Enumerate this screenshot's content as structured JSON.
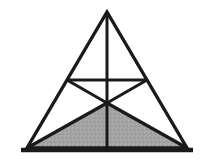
{
  "figure": {
    "title": "Shaded triangle subdivision figure",
    "type": "geometric-diagram",
    "canvas": {
      "width": 202,
      "height": 165,
      "background_color": "#ffffff"
    },
    "colors": {
      "stroke": "#1a1a1a",
      "shade_fill": "#a3a3a3",
      "shade_fill_light": "#b4b4b4",
      "background": "#ffffff"
    },
    "stroke_widths": {
      "outline": 3.4,
      "inner": 3.0,
      "baseline": 4.6
    },
    "points": {
      "apex": {
        "label": "A",
        "x": 107,
        "y": 12
      },
      "bottom_left": {
        "label": "B",
        "x": 27,
        "y": 148
      },
      "bottom_right": {
        "label": "C",
        "x": 187,
        "y": 148
      },
      "left_midpoint": {
        "label": "M",
        "x": 67,
        "y": 80
      },
      "right_midpoint": {
        "label": "N",
        "x": 147,
        "y": 80
      },
      "center": {
        "label": "O",
        "x": 107,
        "y": 103
      },
      "base_midpoint": {
        "label": "D",
        "x": 107,
        "y": 148
      },
      "baseline_left_end": {
        "label": "L",
        "x": 21,
        "y": 150
      },
      "baseline_right_end": {
        "label": "R",
        "x": 193,
        "y": 150
      }
    },
    "shaded_polygon": {
      "name": "lower-shaded-triangle",
      "vertices": "27,148 187,148 107,103"
    },
    "outline_polygon": {
      "name": "main-triangle",
      "vertices": "107,12 187,148 27,148"
    },
    "segments": [
      {
        "name": "midsegment",
        "x1": 67,
        "y1": 80,
        "x2": 147,
        "y2": 80
      },
      {
        "name": "vertical-median",
        "x1": 107,
        "y1": 12,
        "x2": 107,
        "y2": 148
      },
      {
        "name": "left-midpoint-to-center",
        "x1": 67,
        "y1": 80,
        "x2": 107,
        "y2": 103
      },
      {
        "name": "right-midpoint-to-center",
        "x1": 147,
        "y1": 80,
        "x2": 107,
        "y2": 103
      },
      {
        "name": "center-to-bottom-left",
        "x1": 107,
        "y1": 103,
        "x2": 27,
        "y2": 148
      },
      {
        "name": "center-to-bottom-right",
        "x1": 107,
        "y1": 103,
        "x2": 187,
        "y2": 148
      }
    ],
    "baseline": {
      "name": "base-rule",
      "x1": 21,
      "y1": 150,
      "x2": 193,
      "y2": 150
    }
  }
}
